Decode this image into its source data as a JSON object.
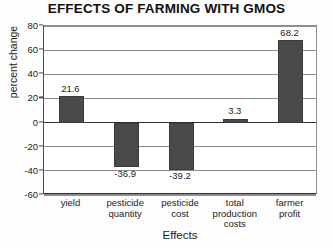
{
  "chart_data": {
    "type": "bar",
    "title": "EFFECTS OF FARMING WITH GMOS",
    "xlabel": "Effects",
    "ylabel": "percent change",
    "categories": [
      "yield",
      "pesticide quantity",
      "pesticide cost",
      "total production costs",
      "farmer profit"
    ],
    "category_lines": [
      [
        "yield"
      ],
      [
        "pesticide",
        "quantity"
      ],
      [
        "pesticide",
        "cost"
      ],
      [
        "total",
        "production",
        "costs"
      ],
      [
        "farmer",
        "profit"
      ]
    ],
    "values": [
      21.6,
      -36.9,
      -39.2,
      3.3,
      68.2
    ],
    "value_labels": [
      "21.6",
      "-36.9",
      "-39.2",
      "3.3",
      "68.2"
    ],
    "ylim": [
      -60,
      80
    ],
    "yticks": [
      80,
      60,
      40,
      20,
      0,
      -20,
      -40,
      -60
    ],
    "ytick_labels": [
      "80",
      "60",
      "40",
      "20",
      "0",
      "-20",
      "-40",
      "-60"
    ],
    "grid": true,
    "legend": "none",
    "bar_color": "#4a4a4a",
    "gridline_color": "#8d8d8d",
    "axis_color": "#2f2f2f",
    "background_color": "#ffffff"
  }
}
